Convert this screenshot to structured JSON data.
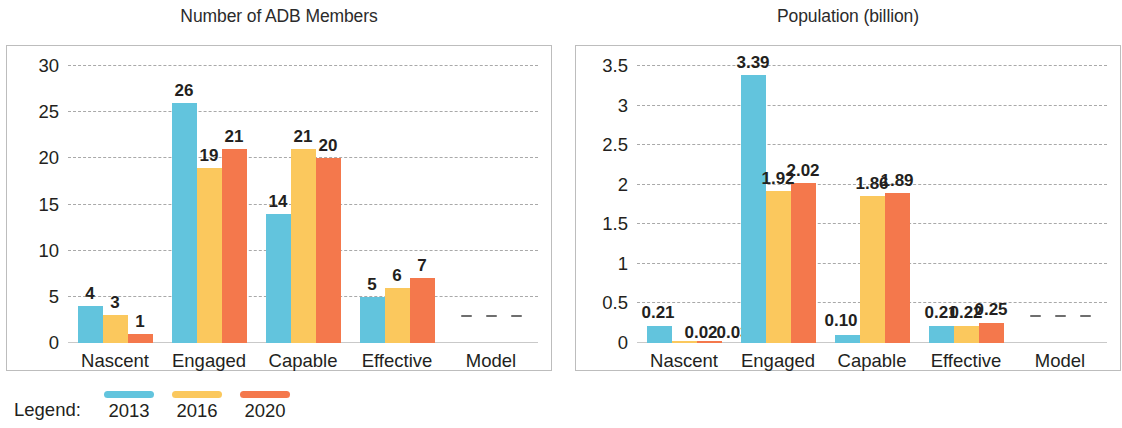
{
  "legend": {
    "label": "Legend:",
    "entries": [
      {
        "year": "2013",
        "color": "#62c4dd"
      },
      {
        "year": "2016",
        "color": "#fbc85d"
      },
      {
        "year": "2020",
        "color": "#f4784c"
      }
    ]
  },
  "chart_data": [
    {
      "type": "bar",
      "title": "Number of ADB Members",
      "xlabel": "",
      "ylabel": "",
      "ylim": [
        0,
        30
      ],
      "yticks": [
        "0",
        "5",
        "10",
        "15",
        "20",
        "25",
        "30"
      ],
      "ytick_values": [
        0,
        5,
        10,
        15,
        20,
        25,
        30
      ],
      "grid": true,
      "legend_position": "below-figure",
      "categories": [
        "Nascent",
        "Engaged",
        "Capable",
        "Effective",
        "Model"
      ],
      "series": [
        {
          "name": "2013",
          "color": "#62c4dd",
          "values": [
            4,
            26,
            14,
            5,
            null
          ],
          "labels": [
            "4",
            "26",
            "14",
            "5",
            "–"
          ]
        },
        {
          "name": "2016",
          "color": "#fbc85d",
          "values": [
            3,
            19,
            21,
            6,
            null
          ],
          "labels": [
            "3",
            "19",
            "21",
            "6",
            "–"
          ]
        },
        {
          "name": "2020",
          "color": "#f4784c",
          "values": [
            1,
            21,
            20,
            7,
            null
          ],
          "labels": [
            "1",
            "21",
            "20",
            "7",
            "–"
          ]
        }
      ]
    },
    {
      "type": "bar",
      "title": "Population (billion)",
      "xlabel": "",
      "ylabel": "",
      "ylim": [
        0,
        3.5
      ],
      "yticks": [
        "0",
        "0.5",
        "1",
        "1.5",
        "2",
        "2.5",
        "3",
        "3.5"
      ],
      "ytick_values": [
        0,
        0.5,
        1,
        1.5,
        2,
        2.5,
        3,
        3.5
      ],
      "grid": true,
      "legend_position": "below-figure",
      "categories": [
        "Nascent",
        "Engaged",
        "Capable",
        "Effective",
        "Model"
      ],
      "series": [
        {
          "name": "2013",
          "color": "#62c4dd",
          "values": [
            0.21,
            3.39,
            0.1,
            0.21,
            null
          ],
          "labels": [
            "0.21",
            "3.39",
            "0.10",
            "0.21",
            "–"
          ]
        },
        {
          "name": "2016",
          "color": "#fbc85d",
          "values": [
            0.02,
            1.92,
            1.86,
            0.22,
            null
          ],
          "labels": [
            "0.02",
            "1.92",
            "1.86",
            "0.22",
            "–"
          ]
        },
        {
          "name": "2020",
          "color": "#f4784c",
          "values": [
            0.03,
            2.02,
            1.89,
            0.25,
            null
          ],
          "labels": [
            "0.03",
            "2.02",
            "1.89",
            "0.25",
            "–"
          ]
        }
      ]
    }
  ]
}
